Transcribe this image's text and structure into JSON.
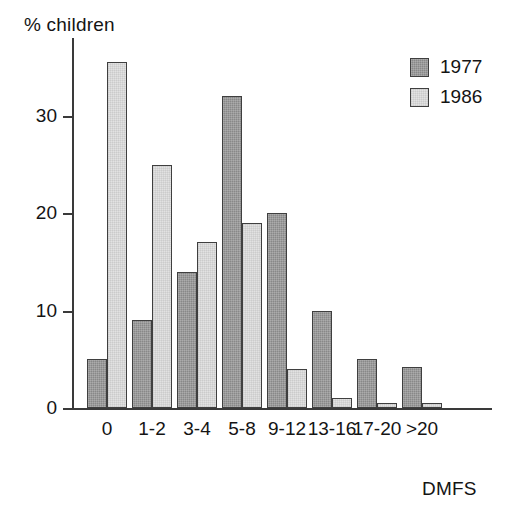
{
  "chart_data": {
    "type": "bar",
    "title": "",
    "subtitle": "",
    "ylabel": "% children",
    "xlabel": "DMFS",
    "categories": [
      "0",
      "1-2",
      "3-4",
      "5-8",
      "9-12",
      "13-16",
      "17-20",
      ">20"
    ],
    "series": [
      {
        "name": "1977",
        "color": "#888888",
        "values": [
          5,
          9,
          14,
          32,
          20,
          10,
          5,
          4.2
        ]
      },
      {
        "name": "1986",
        "color": "#e2e2e2",
        "values": [
          35.5,
          25,
          17,
          19,
          4,
          1,
          0.5,
          0.5
        ]
      }
    ],
    "ylim": [
      0,
      38
    ],
    "yticks": [
      0,
      10,
      20,
      30
    ],
    "ytick_labels": [
      "0",
      "10",
      "20",
      "30"
    ],
    "grid": false,
    "legend_position": "top-right",
    "annotations": []
  },
  "legend": {
    "entries": [
      {
        "label": "1977"
      },
      {
        "label": "1986"
      }
    ]
  },
  "colors": {
    "series_1977": "#888888",
    "series_1986": "#e2e2e2",
    "axis": "#3a3a3a",
    "bar_outline": "#3f3f3f",
    "text": "#141414",
    "background": "#ffffff"
  }
}
